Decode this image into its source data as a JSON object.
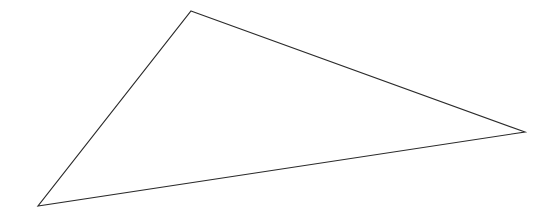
{
  "canvas": {
    "width": 549,
    "height": 220,
    "background_color": "#ffffff",
    "title": "Triangle"
  },
  "figure": {
    "name": "triangle",
    "type": "polygon",
    "sides": 3,
    "classification": "scalene obtuse triangle",
    "fill": "none",
    "fill_color": "#ffffff",
    "stroke_color": "#2b2b2b",
    "stroke_width": 1.15,
    "closed": true,
    "vertices": [
      {
        "label": "apex",
        "x": 191,
        "y": 11
      },
      {
        "label": "right",
        "x": 525,
        "y": 132
      },
      {
        "label": "bottom-left",
        "x": 38,
        "y": 206
      }
    ],
    "points_attr": "191,11 525,132 38,206",
    "edges": [
      {
        "name": "top-right-edge",
        "from": "apex",
        "to": "right"
      },
      {
        "name": "bottom-edge",
        "from": "right",
        "to": "bottom-left"
      },
      {
        "name": "left-edge",
        "from": "bottom-left",
        "to": "apex"
      }
    ]
  }
}
